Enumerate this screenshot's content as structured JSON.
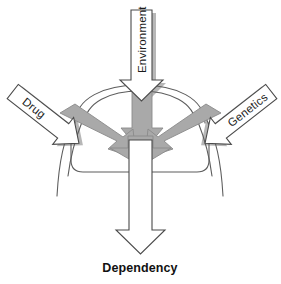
{
  "diagram": {
    "title": "Dependency causal convergence diagram",
    "background_color": "#ffffff",
    "inputs": [
      {
        "id": "drug",
        "label": "Drug",
        "direction": "down-right",
        "position": "left",
        "arrow_fill": "#ffffff",
        "arrow_stroke": "#4a4a4a"
      },
      {
        "id": "environment",
        "label": "Environment",
        "direction": "down",
        "position": "top",
        "arrow_fill": "#ffffff",
        "arrow_stroke": "#4a4a4a"
      },
      {
        "id": "genetics",
        "label": "Genetics",
        "direction": "down-left",
        "position": "right",
        "arrow_fill": "#ffffff",
        "arrow_stroke": "#4a4a4a"
      }
    ],
    "convergence": {
      "shape": "brain-outline",
      "stroke": "#5d5d5d",
      "inner_arrow_fill": "#a9a9a9"
    },
    "output": {
      "id": "dependency",
      "label": "Dependency",
      "direction": "down",
      "arrow_fill": "#ffffff",
      "arrow_stroke": "#4a4a4a",
      "label_weight": "bold"
    },
    "colors": {
      "gray_arrow": "#a9a9a9",
      "shadow": "#b7b7b7",
      "outline": "#4a4a4a",
      "brain_outline": "#5d5d5d",
      "text": "#111111"
    }
  }
}
